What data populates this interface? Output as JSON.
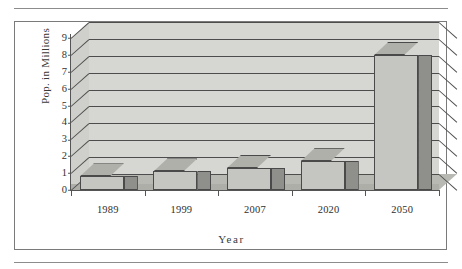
{
  "page": {
    "top_rule": "horizontal-rule",
    "bottom_rule": "horizontal-rule"
  },
  "chart_data": {
    "type": "bar",
    "title": "",
    "subtitle": "",
    "xlabel": "Year",
    "ylabel": "Pop. in Millions",
    "categories": [
      "1989",
      "1999",
      "2007",
      "2020",
      "2050"
    ],
    "values": [
      0.8,
      1.1,
      1.3,
      1.7,
      8.0
    ],
    "series": [
      {
        "name": "Population",
        "values": [
          0.8,
          1.1,
          1.3,
          1.7,
          8.0
        ]
      }
    ],
    "ylim": [
      0,
      9
    ],
    "ytick_labels": [
      "0",
      "1",
      "2",
      "3",
      "4",
      "5",
      "6",
      "7",
      "8",
      "9"
    ],
    "ytick_values": [
      0,
      1,
      2,
      3,
      4,
      5,
      6,
      7,
      8,
      9
    ],
    "grid": true,
    "grid_axis": "y",
    "legend": false,
    "legend_position": "none",
    "style": "3d-column",
    "colors": {
      "bar_front": "#c5c5c1",
      "bar_side": "#8f8f8b",
      "bar_top": "#b0b0ab",
      "bar_outline": "#4a4a4a",
      "wall": "#d6d6d2",
      "floor": "#b9b9b4",
      "gridline": "#4d4d4d",
      "axis": "#555555",
      "text": "#2e2e2e",
      "frame": "#7a7a7a",
      "background": "#ffffff"
    }
  }
}
